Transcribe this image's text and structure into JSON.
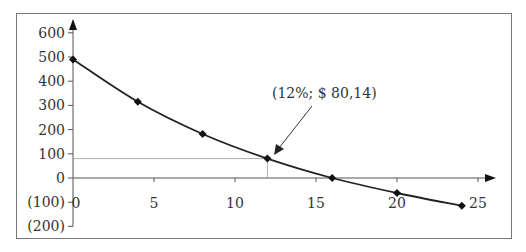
{
  "chart_data": {
    "type": "line",
    "title": "",
    "xlabel": "",
    "ylabel": "",
    "x": [
      0,
      4,
      8,
      12,
      16,
      20,
      24
    ],
    "series": [
      {
        "name": "NPV",
        "values": [
          490,
          315,
          182,
          80.14,
          0,
          -62,
          -115
        ]
      }
    ],
    "x_ticks": [
      "0",
      "5",
      "10",
      "15",
      "20",
      "25"
    ],
    "x_tick_values": [
      0,
      5,
      10,
      15,
      20,
      25
    ],
    "y_ticks": [
      "600",
      "500",
      "400",
      "300",
      "200",
      "100",
      "0",
      "(100)",
      "(200)"
    ],
    "y_tick_values": [
      600,
      500,
      400,
      300,
      200,
      100,
      0,
      -100,
      -200
    ],
    "xlim": [
      0,
      25
    ],
    "ylim": [
      -200,
      600
    ],
    "grid": false,
    "legend": "none",
    "annotation": {
      "text": "(12%; $ 80,14)",
      "point": {
        "x": 12,
        "y": 80.14
      }
    },
    "line_color": "#222222",
    "marker": "diamond"
  }
}
